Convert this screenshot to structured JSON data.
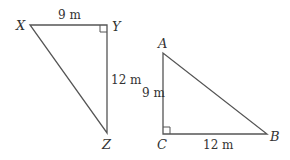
{
  "figures": [
    {
      "name": "triangle-XYZ",
      "vertices": {
        "X": "X",
        "Y": "Y",
        "Z": "Z"
      },
      "side_labels": {
        "XY": "9 m",
        "YZ": "12 m"
      },
      "right_angle_at": "Y"
    },
    {
      "name": "triangle-ABC",
      "vertices": {
        "A": "A",
        "B": "B",
        "C": "C"
      },
      "side_labels": {
        "AC": "9 m",
        "CB": "12 m"
      },
      "right_angle_at": "C"
    }
  ],
  "colors": {
    "stroke": "#555555",
    "text": "#333333"
  }
}
